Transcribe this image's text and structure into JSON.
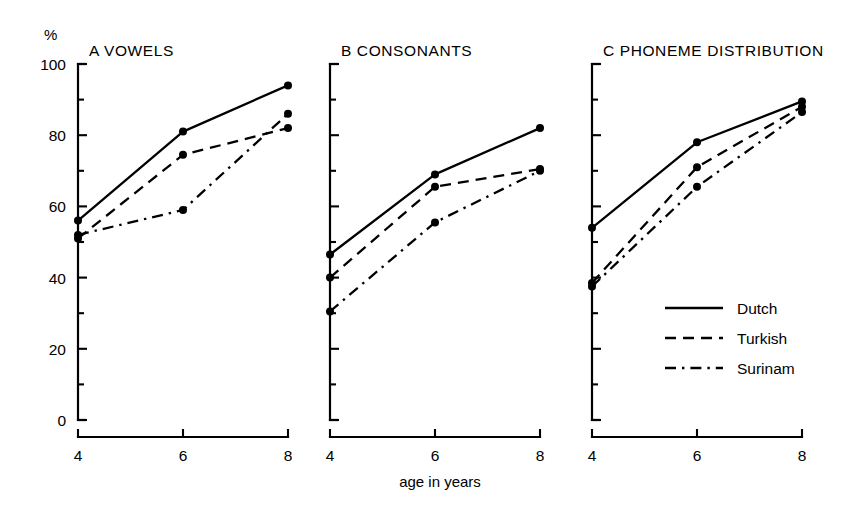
{
  "figure": {
    "unit_label": "%",
    "x_axis_title": "age in years",
    "background": "#ffffff",
    "ink_color": "#000000"
  },
  "axis": {
    "y_tick_labels": [
      "0",
      "20",
      "40",
      "60",
      "80",
      "100"
    ],
    "y_tick_values": [
      0,
      20,
      40,
      60,
      80,
      100
    ],
    "y_minor_values": [
      10,
      30,
      50,
      70,
      90
    ],
    "x_tick_labels": [
      "4",
      "6",
      "8"
    ],
    "x_tick_values": [
      4,
      6,
      8
    ]
  },
  "legend": {
    "position": "inside-panel-c-lower-right",
    "entries": [
      {
        "label": "Dutch",
        "style": "solid"
      },
      {
        "label": "Turkish",
        "style": "dashed"
      },
      {
        "label": "Surinam",
        "style": "dash-dot"
      }
    ]
  },
  "panels": [
    {
      "key": "a",
      "title": "A VOWELS"
    },
    {
      "key": "b",
      "title": "B CONSONANTS"
    },
    {
      "key": "c",
      "title": "C PHONEME DISTRIBUTION"
    }
  ],
  "chart_data": [
    {
      "type": "line",
      "title": "A VOWELS",
      "xlabel": "age in years",
      "ylabel": "%",
      "x": [
        4,
        6,
        8
      ],
      "xticklabels": [
        "4",
        "6",
        "8"
      ],
      "ylim": [
        0,
        100
      ],
      "xlim": [
        4,
        8
      ],
      "grid": false,
      "legend": "shared",
      "series": [
        {
          "name": "Dutch",
          "style": "solid",
          "values": [
            56,
            81,
            94
          ]
        },
        {
          "name": "Turkish",
          "style": "dashed",
          "values": [
            51,
            74.5,
            82
          ]
        },
        {
          "name": "Surinam",
          "style": "dash-dot",
          "values": [
            52,
            59,
            86
          ]
        }
      ]
    },
    {
      "type": "line",
      "title": "B CONSONANTS",
      "xlabel": "age in years",
      "ylabel": "%",
      "x": [
        4,
        6,
        8
      ],
      "xticklabels": [
        "4",
        "6",
        "8"
      ],
      "ylim": [
        0,
        100
      ],
      "xlim": [
        4,
        8
      ],
      "grid": false,
      "legend": "shared",
      "series": [
        {
          "name": "Dutch",
          "style": "solid",
          "values": [
            46.5,
            69,
            82
          ]
        },
        {
          "name": "Turkish",
          "style": "dashed",
          "values": [
            40,
            65.5,
            70.5
          ]
        },
        {
          "name": "Surinam",
          "style": "dash-dot",
          "values": [
            30.5,
            55.5,
            70
          ]
        }
      ]
    },
    {
      "type": "line",
      "title": "C PHONEME DISTRIBUTION",
      "xlabel": "age in years",
      "ylabel": "%",
      "x": [
        4,
        6,
        8
      ],
      "xticklabels": [
        "4",
        "6",
        "8"
      ],
      "ylim": [
        0,
        100
      ],
      "xlim": [
        4,
        8
      ],
      "grid": false,
      "legend": "inside",
      "series": [
        {
          "name": "Dutch",
          "style": "solid",
          "values": [
            54,
            78,
            89.5
          ]
        },
        {
          "name": "Turkish",
          "style": "dashed",
          "values": [
            38.5,
            71,
            88
          ]
        },
        {
          "name": "Surinam",
          "style": "dash-dot",
          "values": [
            37.5,
            65.5,
            86.5
          ]
        }
      ]
    }
  ]
}
